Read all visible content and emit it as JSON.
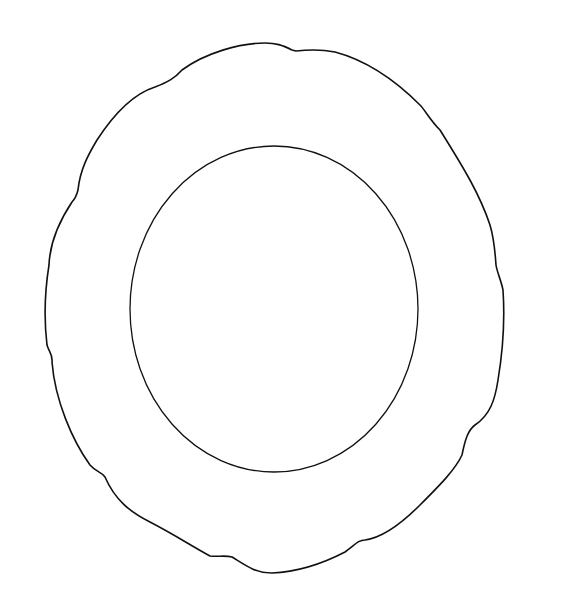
{
  "image": {
    "subject": "plate line drawing",
    "background_color": "#ffffff",
    "line_color": "#111111",
    "outer_rim": {
      "shape": "scalloped",
      "stroke_width": 1.6
    },
    "inner_well": {
      "shape": "ellipse",
      "cx": 274,
      "cy": 309,
      "rx": 144,
      "ry": 163,
      "stroke_width": 1.3
    }
  }
}
